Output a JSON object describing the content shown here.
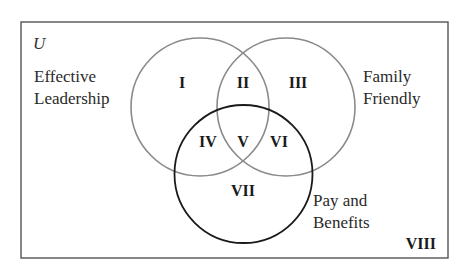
{
  "diagram": {
    "type": "venn",
    "universe_label": "U",
    "sets": [
      {
        "id": "A",
        "label_line1": "Effective",
        "label_line2": "Leadership",
        "stroke": "#8a8a8a"
      },
      {
        "id": "B",
        "label_line1": "Family",
        "label_line2": "Friendly",
        "stroke": "#8a8a8a"
      },
      {
        "id": "C",
        "label_line1": "Pay and",
        "label_line2": "Benefits",
        "stroke": "#1a1a1a"
      }
    ],
    "regions": {
      "r1": "I",
      "r2": "II",
      "r3": "III",
      "r4": "IV",
      "r5": "V",
      "r6": "VI",
      "r7": "VII",
      "r8": "VIII"
    }
  }
}
